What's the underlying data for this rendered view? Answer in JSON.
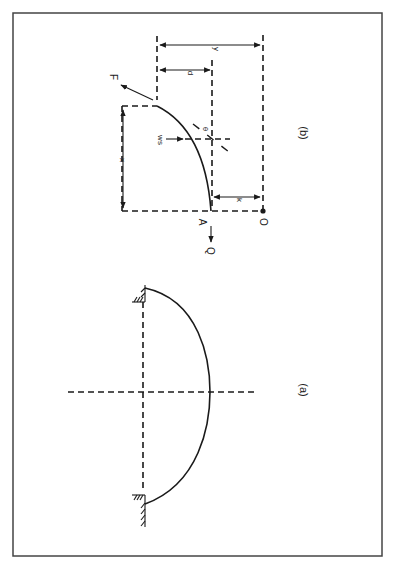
{
  "figure": {
    "orientation": "rotated 90 degrees clockwise",
    "border_color": "#444444",
    "line_color": "#1a1a1a"
  },
  "panel_a": {
    "label": "(a)",
    "description": "Hanging cable/arch between two fixed supports with symmetry axes"
  },
  "panel_b": {
    "label": "(b)",
    "labels": {
      "force_end": "F",
      "force_origin": "Q",
      "point_a": "A",
      "origin": "O",
      "x_dim": "x",
      "y_dim": "y",
      "d_dim": "d",
      "k_dim": "k",
      "load": "ws",
      "angle": "θ"
    }
  }
}
